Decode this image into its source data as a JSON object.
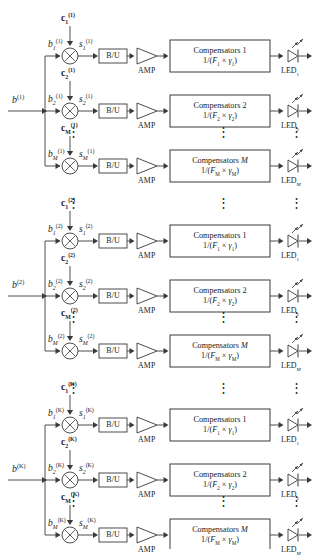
{
  "figure": {
    "type": "block-diagram",
    "background": "#ffffff",
    "line_color": "#3a3a3a",
    "blocks_count": 3,
    "rows_per_block": 3
  },
  "labels": {
    "bu": "B/U",
    "amp": "AMP",
    "led": "LED",
    "compensators": "Compensators",
    "vdots": "⋮"
  },
  "users": [
    {
      "index": "1",
      "superscript": "(1)",
      "input_label": "b",
      "rows": [
        {
          "sub": "1",
          "b": "b",
          "c": "c",
          "s": "s",
          "comp_title": "Compensators 1",
          "comp_expr": "1/(F₁ × γ₁)",
          "comp_F": "F",
          "comp_g": "γ",
          "comp_sub": "1",
          "led_sub": "1"
        },
        {
          "sub": "2",
          "b": "b",
          "c": "c",
          "s": "s",
          "comp_title": "Compensators 2",
          "comp_expr": "1/(F₂ × γ₂)",
          "comp_F": "F",
          "comp_g": "γ",
          "comp_sub": "2",
          "led_sub": "2"
        },
        {
          "sub": "M",
          "b": "b",
          "c": "c",
          "s": "s",
          "comp_title": "Compensators M",
          "comp_expr": "1/(Fₘ × γₘ)",
          "comp_F": "F",
          "comp_g": "γ",
          "comp_sub": "M",
          "led_sub": "M"
        }
      ]
    },
    {
      "index": "2",
      "superscript": "(2)",
      "input_label": "b",
      "rows": [
        {
          "sub": "1",
          "b": "b",
          "c": "c",
          "s": "s",
          "comp_title": "Compensators 1",
          "comp_expr": "1/(F₁ × γ₁)",
          "comp_F": "F",
          "comp_g": "γ",
          "comp_sub": "1",
          "led_sub": "1"
        },
        {
          "sub": "2",
          "b": "b",
          "c": "c",
          "s": "s",
          "comp_title": "Compensators 2",
          "comp_expr": "1/(F₂ × γ₂)",
          "comp_F": "F",
          "comp_g": "γ",
          "comp_sub": "2",
          "led_sub": "2"
        },
        {
          "sub": "M",
          "b": "b",
          "c": "c",
          "s": "s",
          "comp_title": "Compensators M",
          "comp_expr": "1/(Fₘ × γₘ)",
          "comp_F": "F",
          "comp_g": "γ",
          "comp_sub": "M",
          "led_sub": "M"
        }
      ]
    },
    {
      "index": "K",
      "superscript": "(K)",
      "input_label": "b",
      "rows": [
        {
          "sub": "1",
          "b": "b",
          "c": "c",
          "s": "s",
          "comp_title": "Compensators 1",
          "comp_expr": "1/(F₁ × γ₁)",
          "comp_F": "F",
          "comp_g": "γ",
          "comp_sub": "1",
          "led_sub": "1"
        },
        {
          "sub": "2",
          "b": "b",
          "c": "c",
          "s": "s",
          "comp_title": "Compensators 2",
          "comp_expr": "1/(F₂ × γ₂)",
          "comp_F": "F",
          "comp_g": "γ",
          "comp_sub": "2",
          "led_sub": "2"
        },
        {
          "sub": "M",
          "b": "b",
          "c": "c",
          "s": "s",
          "comp_title": "Compensators M",
          "comp_expr": "1/(Fₘ × γₘ)",
          "comp_F": "F",
          "comp_g": "γ",
          "comp_sub": "M",
          "led_sub": "M"
        }
      ]
    }
  ]
}
